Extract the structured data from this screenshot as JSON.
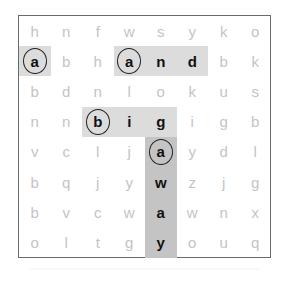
{
  "puzzle": {
    "type": "word-search",
    "rows": 8,
    "cols": 8,
    "grid": [
      [
        "h",
        "n",
        "f",
        "w",
        "s",
        "y",
        "k",
        "o"
      ],
      [
        "a",
        "b",
        "h",
        "a",
        "n",
        "d",
        "b",
        "k"
      ],
      [
        "b",
        "d",
        "n",
        "l",
        "o",
        "k",
        "u",
        "s"
      ],
      [
        "n",
        "n",
        "b",
        "i",
        "g",
        "i",
        "g",
        "b"
      ],
      [
        "v",
        "c",
        "l",
        "j",
        "a",
        "y",
        "d",
        "l"
      ],
      [
        "b",
        "q",
        "j",
        "y",
        "w",
        "z",
        "j",
        "g"
      ],
      [
        "b",
        "v",
        "c",
        "w",
        "a",
        "w",
        "n",
        "x"
      ],
      [
        "o",
        "l",
        "t",
        "g",
        "y",
        "o",
        "u",
        "q"
      ]
    ],
    "found_words": [
      {
        "word": "a",
        "start": [
          1,
          0
        ],
        "direction": "horizontal",
        "length": 1
      },
      {
        "word": "and",
        "start": [
          1,
          3
        ],
        "direction": "horizontal",
        "length": 3
      },
      {
        "word": "big",
        "start": [
          3,
          2
        ],
        "direction": "horizontal",
        "length": 3
      },
      {
        "word": "away",
        "start": [
          4,
          4
        ],
        "direction": "vertical",
        "length": 4
      }
    ],
    "colors": {
      "highlight": "#dcdcdc",
      "highlight_vertical": "#c4c4c4",
      "found_letter": "#111111",
      "unfound_letter": "#c4c4c4",
      "border": "#6a6a6a"
    }
  }
}
